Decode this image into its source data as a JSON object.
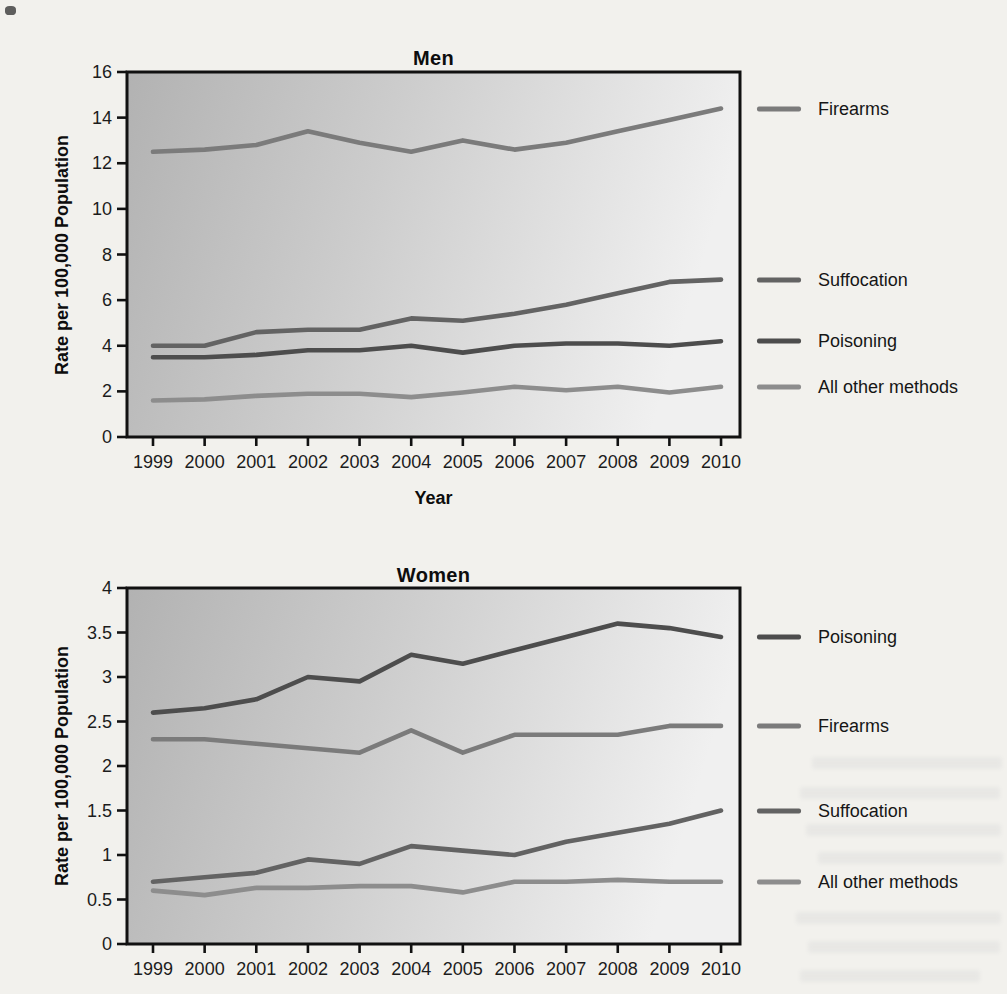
{
  "page": {
    "background_color": "#f2f1ed"
  },
  "chart_data": [
    {
      "type": "line",
      "title": "Men",
      "ylabel": "Rate per 100,000 Population",
      "xlabel": "Year",
      "x": [
        1999,
        2000,
        2001,
        2002,
        2003,
        2004,
        2005,
        2006,
        2007,
        2008,
        2009,
        2010
      ],
      "ylim": [
        0,
        16
      ],
      "ytick_step": 2,
      "grid": false,
      "legend_position": "right-outside",
      "plot_bg_gradient": [
        "#b2b2b2",
        "#f0f0f0"
      ],
      "series": [
        {
          "name": "Firearms",
          "color": "#7b7b7b",
          "values": [
            12.5,
            12.6,
            12.8,
            13.4,
            12.9,
            12.5,
            13.0,
            12.6,
            12.9,
            13.4,
            13.9,
            14.4
          ]
        },
        {
          "name": "Suffocation",
          "color": "#636363",
          "values": [
            4.0,
            4.0,
            4.6,
            4.7,
            4.7,
            5.2,
            5.1,
            5.4,
            5.8,
            6.3,
            6.8,
            6.9
          ]
        },
        {
          "name": "Poisoning",
          "color": "#4d4d4d",
          "values": [
            3.5,
            3.5,
            3.6,
            3.8,
            3.8,
            4.0,
            3.7,
            4.0,
            4.1,
            4.1,
            4.0,
            4.2
          ]
        },
        {
          "name": "All other methods",
          "color": "#8d8d8d",
          "values": [
            1.6,
            1.65,
            1.8,
            1.9,
            1.9,
            1.75,
            1.95,
            2.2,
            2.05,
            2.2,
            1.95,
            2.2
          ]
        }
      ]
    },
    {
      "type": "line",
      "title": "Women",
      "ylabel": "Rate per 100,000 Population",
      "x": [
        1999,
        2000,
        2001,
        2002,
        2003,
        2004,
        2005,
        2006,
        2007,
        2008,
        2009,
        2010
      ],
      "ylim": [
        0,
        4
      ],
      "ytick_step": 0.5,
      "grid": false,
      "legend_position": "right-outside",
      "plot_bg_gradient": [
        "#b2b2b2",
        "#f0f0f0"
      ],
      "series": [
        {
          "name": "Poisoning",
          "color": "#4d4d4d",
          "values": [
            2.6,
            2.65,
            2.75,
            3.0,
            2.95,
            3.25,
            3.15,
            3.3,
            3.45,
            3.6,
            3.55,
            3.45
          ]
        },
        {
          "name": "Firearms",
          "color": "#7b7b7b",
          "values": [
            2.3,
            2.3,
            2.25,
            2.2,
            2.15,
            2.4,
            2.15,
            2.35,
            2.35,
            2.35,
            2.45,
            2.45
          ]
        },
        {
          "name": "Suffocation",
          "color": "#636363",
          "values": [
            0.7,
            0.75,
            0.8,
            0.95,
            0.9,
            1.1,
            1.05,
            1.0,
            1.15,
            1.25,
            1.35,
            1.5
          ]
        },
        {
          "name": "All other methods",
          "color": "#8d8d8d",
          "values": [
            0.6,
            0.55,
            0.63,
            0.63,
            0.65,
            0.65,
            0.58,
            0.7,
            0.7,
            0.72,
            0.7,
            0.7
          ]
        }
      ]
    }
  ]
}
